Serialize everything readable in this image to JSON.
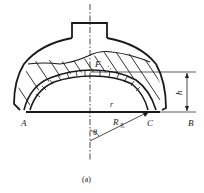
{
  "figure": {
    "caption": "(a)",
    "labels": {
      "A": "A",
      "B": "B",
      "C": "C",
      "F": "F",
      "h": "h",
      "r": "r",
      "R": "R",
      "R_sub": "孔",
      "theta": "θ"
    },
    "colors": {
      "ink": "#1a1a1a",
      "background": "#ffffff"
    }
  }
}
